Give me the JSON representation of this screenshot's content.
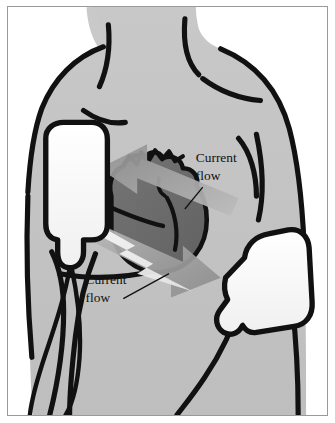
{
  "figure": {
    "border_color": "#9a9a9a",
    "page_background": "#ffffff"
  },
  "colors": {
    "skin": "#c4c4c4",
    "skin_shadow": "#b5b5b5",
    "outline": "#111111",
    "heart_fill": "#6a6a6a",
    "heart_light": "#7d7d7d",
    "pad_fill": "#fdfdfd",
    "arrow_gray": "#9e9e9e",
    "arrow_gray_light": "#b9b9b9",
    "bolt_white": "#f2f2f2",
    "background": "#ffffff"
  },
  "labels": [
    {
      "id": "current-flow-upper",
      "line1": "Current",
      "line2": "flow",
      "x": 196,
      "y": 156,
      "leader": "points down-left toward upper arrow"
    },
    {
      "id": "current-flow-lower",
      "line1": "Current",
      "line2": "flow",
      "x": 86,
      "y": 281,
      "leader": "points up-right toward lower arrow"
    }
  ],
  "pads": [
    {
      "id": "pad-upper-right-chest",
      "shape": "rounded-rectangle-with-tab",
      "position": "upper left of image (patient right chest, below clavicle)",
      "fill": "#fdfdfd",
      "outline": "#111111"
    },
    {
      "id": "pad-lower-left-chest",
      "shape": "angled-rounded-with-tab",
      "position": "lower right of image (patient left lateral chest, mid-axillary)",
      "fill": "#fdfdfd",
      "outline": "#111111"
    }
  ],
  "heart": {
    "id": "heart",
    "fill": "#6a6a6a",
    "outline": "#111111",
    "detail": "great vessels jagged at superior aspect",
    "position": "center of chest, slightly left of midline"
  },
  "arrows": [
    {
      "id": "current-arrow-upper",
      "direction": "up-left",
      "from": "lower-left pad region",
      "to": "upper-right pad region",
      "fill": "#9e9e9e"
    },
    {
      "id": "current-arrow-lower",
      "direction": "down-right",
      "from": "upper-left pad region",
      "to": "lower-right pad",
      "fill": "#9e9e9e"
    },
    {
      "id": "current-bolt",
      "direction": "diagonal",
      "style": "lightning-bolt",
      "fill": "#f2f2f2"
    }
  ],
  "anatomy": {
    "neck": "sternocleidomastoid lines",
    "clavicles": "two clavicle lines below neck",
    "shoulders": "left and right deltoid contours",
    "torso": "chest and abdomen outline",
    "cables": "electrode cables descending from pads"
  }
}
